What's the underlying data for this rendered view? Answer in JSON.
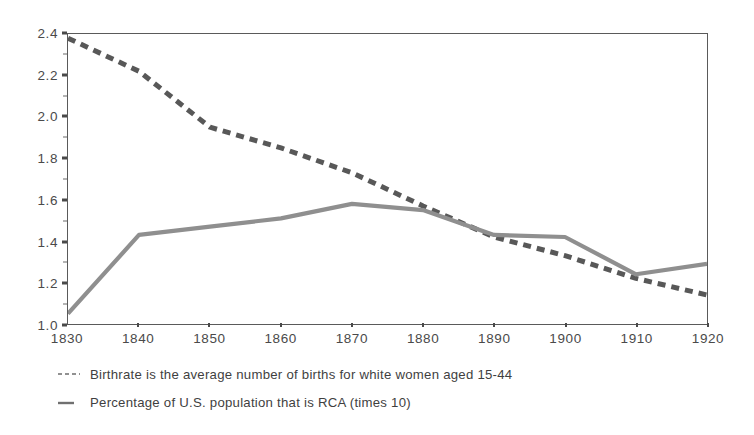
{
  "chart_data": {
    "type": "line",
    "title": "",
    "subtitle": "",
    "xlabel": "",
    "ylabel": "",
    "x": [
      1830,
      1840,
      1850,
      1860,
      1870,
      1880,
      1890,
      1900,
      1910,
      1920
    ],
    "xlim": [
      1830,
      1920
    ],
    "ylim": [
      1.0,
      2.4
    ],
    "grid": false,
    "legend_position": "below-plot-left",
    "x_tick_labels": [
      "1830",
      "1840",
      "1850",
      "1860",
      "1870",
      "1880",
      "1890",
      "1900",
      "1910",
      "1920"
    ],
    "y_tick_labels": [
      "1.0",
      "1.2",
      "1.4",
      "1.6",
      "1.8",
      "2.0",
      "2.2",
      "2.4"
    ],
    "y_tick_values": [
      1.0,
      1.2,
      1.4,
      1.6,
      1.8,
      2.0,
      2.2,
      2.4
    ],
    "y_minor_tick_values": [
      1.1,
      1.3,
      1.5,
      1.7,
      1.9,
      2.1,
      2.3
    ],
    "series": [
      {
        "name": "Birthrate is the average number of births for white women aged 15-44",
        "short_name": "Birthrate",
        "style": "dashed",
        "color": "#585858",
        "legend_marker": "dashed-line-swatch",
        "values": [
          2.38,
          2.22,
          1.95,
          1.85,
          1.73,
          1.57,
          1.42,
          1.33,
          1.22,
          1.14
        ]
      },
      {
        "name": "Percentage of U.S. population that is RCA (times 10)",
        "short_name": "Percentage of U.S. population that is RCA (times 10)",
        "style": "solid",
        "color": "#8f8f8f",
        "legend_marker": "solid-line-swatch",
        "values": [
          1.05,
          1.43,
          1.47,
          1.51,
          1.58,
          1.55,
          1.43,
          1.42,
          1.24,
          1.29
        ]
      }
    ]
  },
  "legend": {
    "items": [
      {
        "label": "Birthrate is the average number of births for white women aged 15-44"
      },
      {
        "label": "Percentage of U.S. population that is RCA (times 10)"
      }
    ]
  }
}
